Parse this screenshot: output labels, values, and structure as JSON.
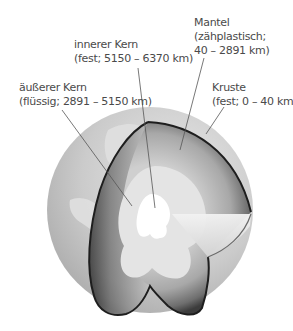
{
  "labels": {
    "mantel": {
      "name": "Mantel",
      "detail_1": "(zähplastisch;",
      "detail_2": "40 – 2891 km)"
    },
    "inner_core": {
      "name": "innerer Kern",
      "detail": "(fest; 5150 – 6370 km)"
    },
    "outer_core": {
      "name": "äußerer Kern",
      "detail": "(flüssig; 2891 – 5150 km)"
    },
    "crust": {
      "name": "Kruste",
      "detail": "(fest; 0 – 40 km)"
    }
  },
  "layers": [
    {
      "name": "Kruste",
      "state": "fest",
      "depth_from_km": 0,
      "depth_to_km": 40
    },
    {
      "name": "Mantel",
      "state": "zähplastisch",
      "depth_from_km": 40,
      "depth_to_km": 2891
    },
    {
      "name": "äußerer Kern",
      "state": "flüssig",
      "depth_from_km": 2891,
      "depth_to_km": 5150
    },
    {
      "name": "innerer Kern",
      "state": "fest",
      "depth_from_km": 5150,
      "depth_to_km": 6370
    }
  ],
  "colors": {
    "globe": "#c9c9c9",
    "continents": "#dedede",
    "mantle_dark": "#5a5a5a",
    "mantle_light": "#bdbdbd",
    "outer_core": "#e6e6e6",
    "inner_core": "#ffffff",
    "outline": "#1e1e1e",
    "leader_line": "#555555",
    "text": "#4a4a4a"
  }
}
